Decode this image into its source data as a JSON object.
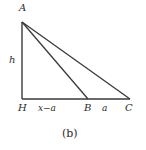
{
  "figure": {
    "caption": "(b)",
    "stroke_color": "#3a3a3a",
    "text_color": "#2b2b2b",
    "background_color": "#ffffff",
    "vertices": {
      "A": {
        "label": "A",
        "x": 22,
        "y": 22
      },
      "H": {
        "label": "H",
        "x": 22,
        "y": 99
      },
      "B": {
        "label": "B",
        "x": 88,
        "y": 99
      },
      "C": {
        "label": "C",
        "x": 130,
        "y": 99
      }
    },
    "edge_labels": {
      "height": "h",
      "segment_HB": "x−a",
      "segment_BC": "a"
    },
    "segments": [
      {
        "name": "A-H",
        "from": "A",
        "to": "H"
      },
      {
        "name": "H-C",
        "from": "H",
        "to": "C"
      },
      {
        "name": "A-B",
        "from": "A",
        "to": "B"
      },
      {
        "name": "A-C",
        "from": "A",
        "to": "C"
      }
    ]
  }
}
